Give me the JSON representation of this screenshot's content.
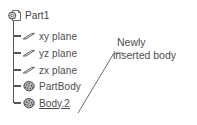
{
  "tree": {
    "root": {
      "label": "Part1",
      "icon": "part-document-icon"
    },
    "items": [
      {
        "label": "xy plane",
        "icon": "plane-icon",
        "selected": false
      },
      {
        "label": "yz plane",
        "icon": "plane-icon",
        "selected": false
      },
      {
        "label": "zx plane",
        "icon": "plane-icon",
        "selected": false
      },
      {
        "label": "PartBody",
        "icon": "solid-body-icon",
        "selected": false
      },
      {
        "label": "Body.2",
        "icon": "solid-body-icon",
        "selected": true
      }
    ]
  },
  "callout": {
    "line1": "Newly",
    "line2": "inserted body",
    "target_label": "Body.2"
  },
  "colors": {
    "text": "#4d4d4d",
    "line": "#666666",
    "background": "#ffffff"
  }
}
